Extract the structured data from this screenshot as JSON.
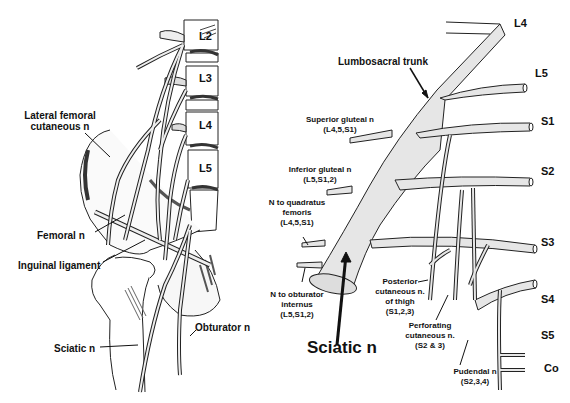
{
  "left_panel": {
    "vertebrae": [
      "L2",
      "L3",
      "L4",
      "L5"
    ],
    "labels": {
      "lateral_femoral_cutaneous": [
        "Lateral femoral",
        "cutaneous n"
      ],
      "femoral": "Femoral n",
      "inguinal_ligament": "Inguinal ligament",
      "sciatic": "Sciatic n",
      "obturator": "Obturator n"
    }
  },
  "right_panel": {
    "roots": [
      "L4",
      "L5",
      "S1",
      "S2",
      "S3",
      "S4",
      "S5",
      "Co"
    ],
    "labels": {
      "lumbosacral_trunk": "Lumbosacral trunk",
      "superior_gluteal": [
        "Superior gluteal n",
        "(L4,5,S1)"
      ],
      "inferior_gluteal": [
        "Inferior gluteal n",
        "(L5,S1,2)"
      ],
      "quadratus_femoris": [
        "N to quadratus",
        "femoris",
        "(L4,5,S1)"
      ],
      "obturator_internus": [
        "N to obturator",
        "internus",
        "(L5,S1,2)"
      ],
      "posterior_cutaneous": [
        "Posterior",
        "cutaneous n.",
        "of thigh",
        "(S1,2,3)"
      ],
      "perforating_cutaneous": [
        "Perforating",
        "cutaneous n.",
        "(S2 & 3)"
      ],
      "pudendal": [
        "Pudendal n",
        "(S2,3,4)"
      ],
      "sciatic": "Sciatic n"
    }
  }
}
